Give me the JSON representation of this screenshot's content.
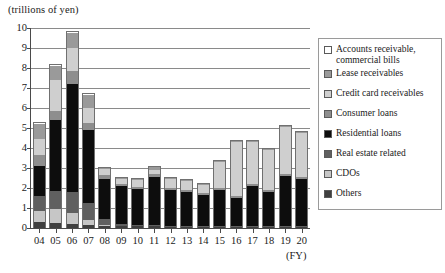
{
  "chart_data": {
    "type": "bar",
    "stacked": true,
    "title": "",
    "subtitle": "",
    "xlabel": "(FY)",
    "ylabel": "(trillions of yen)",
    "ylim": [
      0,
      10
    ],
    "ytick_step": 1,
    "grid": true,
    "legend_position": "right",
    "categories": [
      "04",
      "05",
      "06",
      "07",
      "08",
      "09",
      "10",
      "11",
      "12",
      "13",
      "14",
      "15",
      "16",
      "17",
      "18",
      "19",
      "20"
    ],
    "ytick_labels": [
      "10",
      "9",
      "8",
      "7",
      "6",
      "5",
      "4",
      "3",
      "2",
      "1",
      "0"
    ],
    "series": [
      {
        "name": "Others",
        "color": "#3f3f3f",
        "values": [
          0.3,
          0.25,
          0.2,
          0.15,
          0.1,
          0.08,
          0.08,
          0.08,
          0.07,
          0.05,
          0.05,
          0.05,
          0.05,
          0.05,
          0.05,
          0.05,
          0.05
        ]
      },
      {
        "name": "CDOs",
        "color": "#c6c6c6",
        "values": [
          0.55,
          0.7,
          0.55,
          0.25,
          0.05,
          0.0,
          0.0,
          0.0,
          0.0,
          0.0,
          0.0,
          0.0,
          0.0,
          0.0,
          0.0,
          0.0,
          0.0
        ]
      },
      {
        "name": "Real estate related",
        "color": "#606060",
        "values": [
          0.75,
          0.9,
          1.05,
          0.85,
          0.3,
          0.1,
          0.08,
          0.08,
          0.05,
          0.05,
          0.05,
          0.05,
          0.05,
          0.05,
          0.05,
          0.05,
          0.05
        ]
      },
      {
        "name": "Residential loans",
        "color": "#0d0d0d",
        "values": [
          1.55,
          3.6,
          5.45,
          3.7,
          2.05,
          1.95,
          1.85,
          2.45,
          1.8,
          1.75,
          1.6,
          1.85,
          1.4,
          2.05,
          1.7,
          2.55,
          2.4
        ]
      },
      {
        "name": "Consumer loans",
        "color": "#8e8e8e",
        "values": [
          0.55,
          0.45,
          0.65,
          0.35,
          0.2,
          0.1,
          0.1,
          0.15,
          0.1,
          0.1,
          0.1,
          0.1,
          0.1,
          0.1,
          0.1,
          0.1,
          0.1
        ]
      },
      {
        "name": "Credit card receivables",
        "color": "#cfcfcf",
        "values": [
          0.8,
          1.55,
          1.15,
          0.75,
          0.3,
          0.25,
          0.35,
          0.2,
          0.5,
          0.45,
          0.4,
          1.3,
          2.75,
          2.1,
          2.05,
          2.35,
          2.2
        ]
      },
      {
        "name": "Lease receivables",
        "color": "#9a9a9a",
        "values": [
          0.75,
          0.7,
          0.75,
          0.65,
          0.05,
          0.05,
          0.05,
          0.15,
          0.05,
          0.05,
          0.05,
          0.05,
          0.05,
          0.05,
          0.05,
          0.05,
          0.05
        ]
      },
      {
        "name": "Accounts receivable, commercial bills",
        "color": "#ffffff",
        "values": [
          0.05,
          0.05,
          0.05,
          0.05,
          0.0,
          0.0,
          0.0,
          0.0,
          0.0,
          0.0,
          0.0,
          0.0,
          0.0,
          0.0,
          0.0,
          0.0,
          0.0
        ]
      }
    ],
    "totals": [
      5.3,
      8.2,
      9.85,
      6.75,
      3.05,
      2.53,
      2.51,
      3.11,
      2.57,
      2.45,
      2.25,
      3.4,
      4.4,
      4.4,
      4.0,
      5.15,
      4.85
    ]
  },
  "legend": {
    "items": [
      {
        "label": "Accounts receivable,\ncommercial bills",
        "color": "#ffffff"
      },
      {
        "label": "Lease receivables",
        "color": "#9a9a9a"
      },
      {
        "label": "Credit card receivables",
        "color": "#cfcfcf"
      },
      {
        "label": "Consumer loans",
        "color": "#8e8e8e"
      },
      {
        "label": "Residential loans",
        "color": "#0d0d0d"
      },
      {
        "label": "Real estate related",
        "color": "#606060"
      },
      {
        "label": "CDOs",
        "color": "#c6c6c6"
      },
      {
        "label": "Others",
        "color": "#3f3f3f"
      }
    ]
  }
}
